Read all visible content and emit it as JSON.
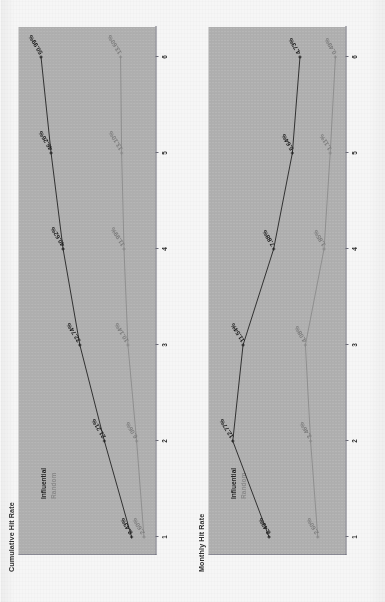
{
  "page": {
    "background_color": "#ffffff",
    "plot_background_color": "#b3b3b3"
  },
  "legend": {
    "influential_label": "Influential",
    "random_label": "Random",
    "influential_color": "#1c1c1c",
    "random_color": "#8d8d8d"
  },
  "charts": [
    {
      "id": "cumulative",
      "title": "Cumulative Hit Rate"
    },
    {
      "id": "monthly",
      "title": "Monthly Hit Rate"
    }
  ],
  "chart_data": [
    {
      "type": "line",
      "title": "Cumulative Hit Rate",
      "xlabel": "",
      "ylabel": "",
      "categories": [
        "1",
        "2",
        "3",
        "4",
        "5",
        "6"
      ],
      "x": [
        1,
        2,
        3,
        4,
        5,
        6
      ],
      "xlim": [
        1,
        6
      ],
      "ylim": [
        0,
        55
      ],
      "grid": false,
      "legend_position": "top-left",
      "value_format": "percent",
      "series": [
        {
          "name": "Influential",
          "color": "#1c1c1c",
          "values": [
            8.43,
            21.21,
            32.74,
            40.62,
            46.26,
            50.99
          ],
          "labels": [
            "8.43%",
            "21.21%",
            "32.74%",
            "40.62%",
            "46.26%",
            "50.99%"
          ]
        },
        {
          "name": "Random",
          "color": "#8d8d8d",
          "values": [
            2.6,
            6.06,
            10.14,
            11.99,
            13.1,
            13.6
          ],
          "labels": [
            "2.60%",
            "6.06%",
            "10.14%",
            "11.99%",
            "13.10%",
            "13.60%"
          ]
        }
      ]
    },
    {
      "type": "line",
      "title": "Monthly Hit Rate",
      "xlabel": "",
      "ylabel": "",
      "categories": [
        "1",
        "2",
        "3",
        "4",
        "5",
        "6"
      ],
      "x": [
        1,
        2,
        3,
        4,
        5,
        6
      ],
      "xlim": [
        1,
        6
      ],
      "ylim": [
        0,
        14
      ],
      "grid": false,
      "legend_position": "top-left",
      "value_format": "percent",
      "series": [
        {
          "name": "Influential",
          "color": "#1c1c1c",
          "values": [
            8.43,
            12.77,
            11.54,
            7.88,
            5.64,
            4.73
          ],
          "labels": [
            "8.43%",
            "12.77%",
            "11.54%",
            "7.88%",
            "5.64%",
            "4.73%"
          ]
        },
        {
          "name": "Random",
          "color": "#8d8d8d",
          "values": [
            2.6,
            3.46,
            4.08,
            1.85,
            1.11,
            0.49
          ],
          "labels": [
            "2.60%",
            "3.46%",
            "4.08%",
            "1.85%",
            "1.11%",
            "0.49%"
          ]
        }
      ]
    }
  ]
}
